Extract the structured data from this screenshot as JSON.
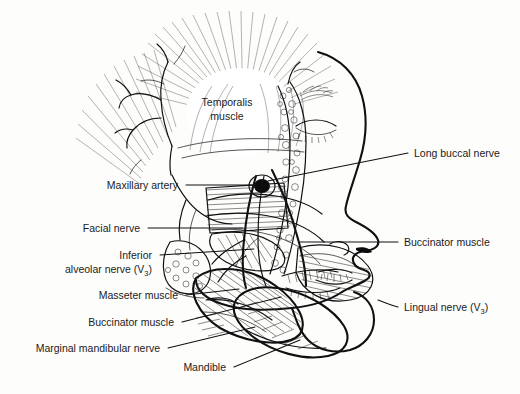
{
  "figure": {
    "title": "Lateral view of head showing muscles of mastication and branches of the mandibular nerve",
    "background_color": "#fdfdfc",
    "ink_color": "#101010",
    "label_color": "#1b1b1b"
  },
  "labels": {
    "temporalis": {
      "line1": "Temporalis",
      "line2": "muscle"
    },
    "maxillary_artery": "Maxillary artery",
    "facial_nerve": "Facial nerve",
    "inferior_alveolar": {
      "line1": "Inferior",
      "line2": "alveolar nerve (V",
      "sub": "3",
      "line2_end": ")"
    },
    "masseter": "Masseter muscle",
    "buccinator_left": "Buccinator muscle",
    "marginal_mandibular": "Marginal mandibular nerve",
    "mandible": "Mandible",
    "long_buccal": "Long buccal nerve",
    "buccinator_right": "Buccinator muscle",
    "lingual_nerve": {
      "text": "Lingual nerve (V",
      "sub": "3",
      "end": ")"
    }
  },
  "label_positions": {
    "temporalis": {
      "x": 227,
      "y": 106,
      "anchor": "middle"
    },
    "maxillary_artery": {
      "x": 178,
      "y": 189,
      "anchor": "end"
    },
    "facial_nerve": {
      "x": 140,
      "y": 231,
      "anchor": "end"
    },
    "inferior_alveolar": {
      "x": 152,
      "y": 259,
      "anchor": "end"
    },
    "masseter": {
      "x": 178,
      "y": 299,
      "anchor": "end"
    },
    "buccinator_left": {
      "x": 174,
      "y": 326,
      "anchor": "end"
    },
    "marginal_mandibular": {
      "x": 160,
      "y": 352,
      "anchor": "end"
    },
    "mandible": {
      "x": 226,
      "y": 371,
      "anchor": "end"
    },
    "long_buccal": {
      "x": 414,
      "y": 157,
      "anchor": "start"
    },
    "buccinator_right": {
      "x": 404,
      "y": 246,
      "anchor": "start"
    },
    "lingual_nerve": {
      "x": 404,
      "y": 311,
      "anchor": "start"
    }
  },
  "leaders": [
    {
      "name": "maxillary-artery-leader",
      "d": "M186,185 L252,185"
    },
    {
      "name": "facial-nerve-leader",
      "d": "M148,228 L243,228"
    },
    {
      "name": "inferior-alveolar-leader",
      "d": "M160,255 L254,249"
    },
    {
      "name": "masseter-leader",
      "d": "M186,295 L239,289"
    },
    {
      "name": "buccinator-left-leader",
      "d": "M182,322 L281,297"
    },
    {
      "name": "marginal-mandibular-leader",
      "d": "M168,348 L255,327"
    },
    {
      "name": "mandible-leader",
      "d": "M234,367 L300,340"
    },
    {
      "name": "long-buccal-leader",
      "d": "M408,153 L268,181"
    },
    {
      "name": "buccinator-right-leader",
      "d": "M398,242 L300,242"
    },
    {
      "name": "lingual-nerve-leader",
      "d": "M398,307 L378,301"
    }
  ]
}
